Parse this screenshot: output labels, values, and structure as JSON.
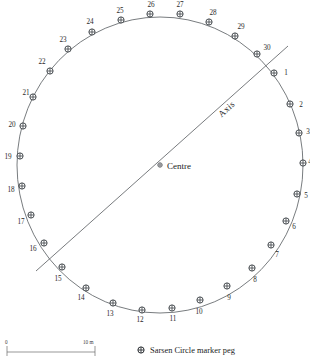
{
  "figure": {
    "centre_label": "Centre",
    "axis_label": "Axis"
  },
  "chart_data": {
    "type": "scatter",
    "xlabel": "",
    "ylabel": "",
    "legend_position": "bottom",
    "grid": false,
    "annotations": [
      "Centre",
      "Axis"
    ],
    "circle": {
      "cx": 160,
      "cy": 165,
      "rx": 143,
      "ry": 148
    },
    "axis_segment": {
      "x1": 36,
      "y1": 271,
      "x2": 288,
      "y2": 46,
      "label": "Axis"
    },
    "centre_point": {
      "x": 160,
      "y": 165,
      "label": "Centre"
    },
    "categories": [
      "1",
      "2",
      "3",
      "4",
      "5",
      "6",
      "7",
      "8",
      "9",
      "10",
      "11",
      "12",
      "13",
      "14",
      "15",
      "16",
      "17",
      "18",
      "19",
      "20",
      "21",
      "22",
      "23",
      "24",
      "25",
      "26",
      "27",
      "28",
      "29",
      "30"
    ],
    "pegs": [
      {
        "id": "1",
        "x": 274,
        "y": 73,
        "lx": 286,
        "ly": 75
      },
      {
        "id": "2",
        "x": 290,
        "y": 104,
        "lx": 301,
        "ly": 107
      },
      {
        "id": "3",
        "x": 299,
        "y": 133,
        "lx": 308,
        "ly": 134
      },
      {
        "id": "4",
        "x": 303,
        "y": 163,
        "lx": 310,
        "ly": 164
      },
      {
        "id": "5",
        "x": 297,
        "y": 194,
        "lx": 306,
        "ly": 198
      },
      {
        "id": "6",
        "x": 286,
        "y": 221,
        "lx": 294,
        "ly": 229
      },
      {
        "id": "7",
        "x": 271,
        "y": 245,
        "lx": 277,
        "ly": 257
      },
      {
        "id": "8",
        "x": 252,
        "y": 268,
        "lx": 255,
        "ly": 282
      },
      {
        "id": "9",
        "x": 227,
        "y": 286,
        "lx": 229,
        "ly": 300
      },
      {
        "id": "10",
        "x": 200,
        "y": 300,
        "lx": 199,
        "ly": 314
      },
      {
        "id": "11",
        "x": 172,
        "y": 308,
        "lx": 173,
        "ly": 321
      },
      {
        "id": "12",
        "x": 142,
        "y": 310,
        "lx": 140,
        "ly": 322
      },
      {
        "id": "13",
        "x": 113,
        "y": 303,
        "lx": 110,
        "ly": 316
      },
      {
        "id": "14",
        "x": 86,
        "y": 288,
        "lx": 81,
        "ly": 300
      },
      {
        "id": "15",
        "x": 62,
        "y": 267,
        "lx": 58,
        "ly": 281
      },
      {
        "id": "16",
        "x": 44,
        "y": 243,
        "lx": 33,
        "ly": 251
      },
      {
        "id": "17",
        "x": 31,
        "y": 215,
        "lx": 21,
        "ly": 224
      },
      {
        "id": "18",
        "x": 22,
        "y": 186,
        "lx": 11,
        "ly": 192
      },
      {
        "id": "19",
        "x": 20,
        "y": 156,
        "lx": 8,
        "ly": 159
      },
      {
        "id": "20",
        "x": 23,
        "y": 126,
        "lx": 12,
        "ly": 127
      },
      {
        "id": "21",
        "x": 33,
        "y": 97,
        "lx": 26,
        "ly": 95
      },
      {
        "id": "22",
        "x": 50,
        "y": 71,
        "lx": 42,
        "ly": 64
      },
      {
        "id": "23",
        "x": 68,
        "y": 49,
        "lx": 63,
        "ly": 42
      },
      {
        "id": "24",
        "x": 92,
        "y": 32,
        "lx": 90,
        "ly": 24
      },
      {
        "id": "25",
        "x": 121,
        "y": 20,
        "lx": 120,
        "ly": 13
      },
      {
        "id": "26",
        "x": 150,
        "y": 14,
        "lx": 151,
        "ly": 7
      },
      {
        "id": "27",
        "x": 180,
        "y": 14,
        "lx": 180,
        "ly": 7
      },
      {
        "id": "28",
        "x": 209,
        "y": 22,
        "lx": 213,
        "ly": 15
      },
      {
        "id": "29",
        "x": 235,
        "y": 36,
        "lx": 241,
        "ly": 29
      },
      {
        "id": "30",
        "x": 257,
        "y": 54,
        "lx": 267,
        "ly": 50
      }
    ]
  },
  "scale": {
    "start_label": "0",
    "end_label": "10 m",
    "unit": "m",
    "length_m": 10
  },
  "legend": {
    "items": [
      {
        "symbol": "peg-marker-icon",
        "label": "Sarsen Circle marker peg"
      }
    ]
  },
  "colors": {
    "line": "#555a5e",
    "text": "#1a1a1a",
    "background": "#ffffff"
  }
}
